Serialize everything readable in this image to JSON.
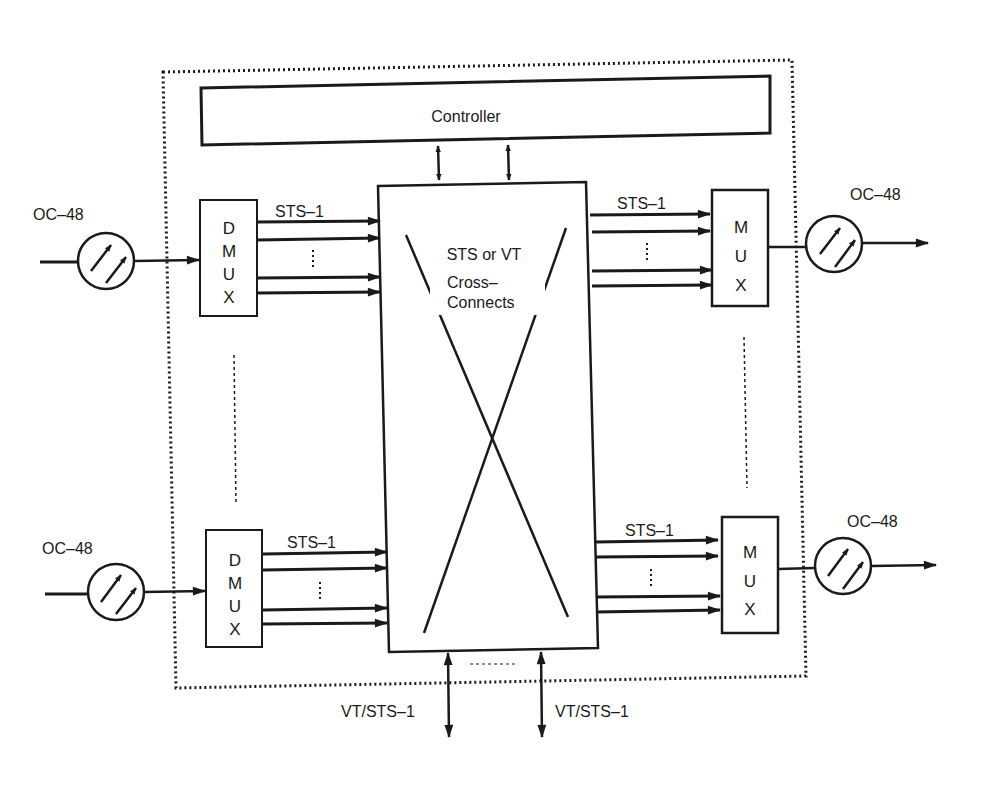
{
  "diagram": {
    "type": "SONET digital cross-connect block diagram",
    "boundary": "dotted-system-boundary",
    "controller": {
      "label": "Controller"
    },
    "cross_connect": {
      "line1": "STS or VT",
      "line2": "Cross–",
      "line3": "Connects"
    },
    "inputs": [
      {
        "port_label": "OC–48",
        "demux_letters": [
          "D",
          "M",
          "U",
          "X"
        ],
        "tributary_label": "STS–1",
        "ellipsis": "⋮"
      },
      {
        "port_label": "OC–48",
        "demux_letters": [
          "D",
          "M",
          "U",
          "X"
        ],
        "tributary_label": "STS–1",
        "ellipsis": "⋮"
      }
    ],
    "outputs": [
      {
        "port_label": "OC–48",
        "mux_letters": [
          "M",
          "U",
          "X"
        ],
        "tributary_label": "STS–1",
        "ellipsis": "⋮"
      },
      {
        "port_label": "OC–48",
        "mux_letters": [
          "M",
          "U",
          "X"
        ],
        "tributary_label": "STS–1",
        "ellipsis": "⋮"
      }
    ],
    "drop_ports": [
      {
        "label": "VT/STS–1"
      },
      {
        "label": "VT/STS–1"
      }
    ],
    "colors": {
      "ink": "#1a1a1a",
      "background": "#ffffff"
    }
  }
}
